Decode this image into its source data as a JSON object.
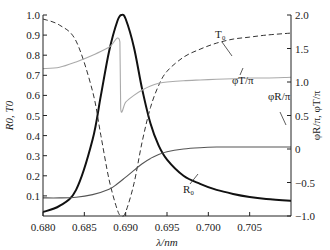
{
  "chart_data": {
    "type": "line",
    "title": "",
    "xlabel": "λ/nm",
    "ylabel_left": "R0, T0",
    "ylabel_right": "φR/π, φT/π",
    "xlim": [
      0.68,
      0.71
    ],
    "ylim_left": [
      0.0,
      1.0
    ],
    "ylim_right": [
      -1.0,
      2.0
    ],
    "x_ticks": [
      "0.680",
      "0.685",
      "0.690",
      "0.695",
      "0.700",
      "0.705"
    ],
    "y_left_ticks": [
      "0.1",
      "0.2",
      "0.3",
      "0.4",
      "0.5",
      "0.6",
      "0.7",
      "0.8",
      "0.9",
      "1.0"
    ],
    "y_right_ticks": [
      "-1.0",
      "-0.5",
      "0",
      "0.5",
      "1.0",
      "1.5",
      "2.0"
    ],
    "grid": false,
    "series": [
      {
        "name": "R0",
        "label": "R₀",
        "axis": "left",
        "style": "solid-thick",
        "x": [
          0.68,
          0.682,
          0.684,
          0.686,
          0.687,
          0.688,
          0.689,
          0.6895,
          0.69,
          0.691,
          0.692,
          0.693,
          0.694,
          0.695,
          0.697,
          0.699,
          0.701,
          0.703,
          0.705,
          0.707,
          0.71
        ],
        "y": [
          0.02,
          0.05,
          0.13,
          0.38,
          0.6,
          0.82,
          0.97,
          1.0,
          0.98,
          0.84,
          0.63,
          0.46,
          0.35,
          0.28,
          0.2,
          0.16,
          0.13,
          0.11,
          0.095,
          0.085,
          0.075
        ]
      },
      {
        "name": "T0",
        "label": "T₀",
        "axis": "left",
        "style": "dashed",
        "x": [
          0.68,
          0.682,
          0.684,
          0.686,
          0.687,
          0.688,
          0.689,
          0.6895,
          0.69,
          0.691,
          0.692,
          0.693,
          0.694,
          0.695,
          0.697,
          0.699,
          0.701,
          0.703,
          0.705,
          0.707,
          0.71
        ],
        "y": [
          0.98,
          0.95,
          0.87,
          0.62,
          0.4,
          0.18,
          0.03,
          0.0,
          0.02,
          0.16,
          0.37,
          0.54,
          0.65,
          0.72,
          0.79,
          0.83,
          0.86,
          0.88,
          0.89,
          0.9,
          0.91
        ]
      },
      {
        "name": "phiT/pi",
        "label": "φT/π",
        "axis": "right",
        "style": "solid-light-gray",
        "x": [
          0.68,
          0.682,
          0.684,
          0.686,
          0.688,
          0.6893,
          0.6894,
          0.69,
          0.691,
          0.692,
          0.693,
          0.694,
          0.695,
          0.697,
          0.699,
          0.701,
          0.703,
          0.705,
          0.707,
          0.71
        ],
        "y": [
          1.2,
          1.22,
          1.3,
          1.4,
          1.52,
          1.6,
          0.6,
          0.7,
          0.8,
          0.88,
          0.94,
          0.98,
          1.0,
          1.02,
          1.03,
          1.04,
          1.05,
          1.06,
          1.06,
          1.07
        ]
      },
      {
        "name": "phiR/pi",
        "label": "φR/π",
        "axis": "right",
        "style": "solid-gray",
        "x": [
          0.68,
          0.682,
          0.684,
          0.686,
          0.688,
          0.689,
          0.69,
          0.691,
          0.692,
          0.693,
          0.694,
          0.695,
          0.697,
          0.699,
          0.701,
          0.703,
          0.705,
          0.707,
          0.71
        ],
        "y": [
          -0.73,
          -0.73,
          -0.72,
          -0.68,
          -0.6,
          -0.52,
          -0.42,
          -0.32,
          -0.22,
          -0.14,
          -0.08,
          -0.04,
          0.0,
          0.02,
          0.03,
          0.03,
          0.03,
          0.03,
          0.03
        ]
      }
    ],
    "annotations": [
      {
        "text": "T₀",
        "x": 0.6965,
        "y_left": 0.86
      },
      {
        "text": "φT/π",
        "x": 0.698,
        "y_left": 0.55
      },
      {
        "text": "φR/π",
        "x": 0.703,
        "y_left": 0.44
      },
      {
        "text": "R₀",
        "x": 0.6945,
        "y_left": 0.1
      }
    ]
  }
}
